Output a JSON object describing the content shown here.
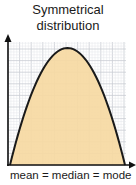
{
  "title": {
    "line1": "Symmetrical",
    "line2": "distribution"
  },
  "caption": "mean = median = mode",
  "colors": {
    "fill": "#f6d9a2",
    "curve": "#1a1a1a",
    "grid_major": "#c9cdd3",
    "grid_minor": "#e4e7eb",
    "axis": "#111111"
  },
  "chart_data": {
    "type": "area",
    "title": "Symmetrical distribution",
    "xlabel": "mean = median = mode",
    "ylabel": "",
    "grid": true,
    "axis_ticks": "none",
    "x": [
      0,
      0.1,
      0.2,
      0.3,
      0.4,
      0.5,
      0.6,
      0.7,
      0.8,
      0.9,
      1.0
    ],
    "values": [
      0,
      0.36,
      0.64,
      0.84,
      0.96,
      1.0,
      0.96,
      0.84,
      0.64,
      0.36,
      0
    ],
    "xlim": [
      0,
      1
    ],
    "ylim": [
      0,
      1.05
    ]
  }
}
